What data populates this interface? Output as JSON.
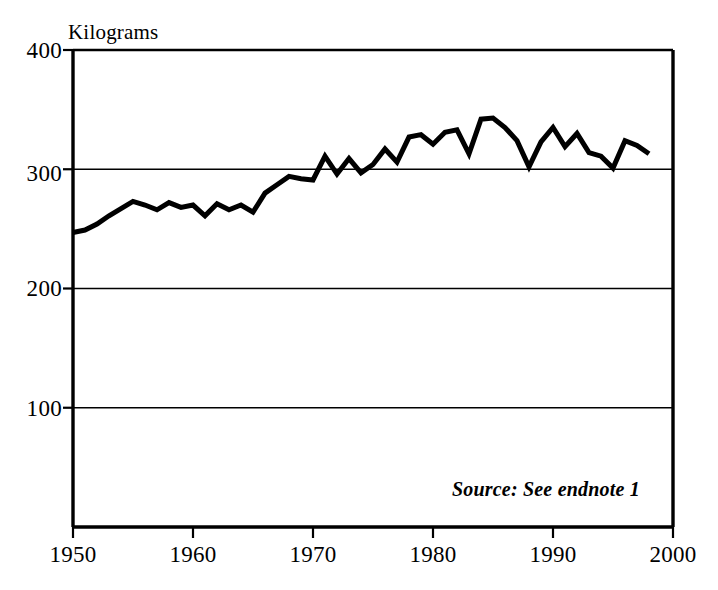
{
  "figure": {
    "y_axis_unit_label": "Kilograms",
    "source_note": "Source: See endnote 1"
  },
  "chart_data": {
    "type": "line",
    "title": "",
    "subtitle": "",
    "xlabel": "",
    "ylabel": "Kilograms",
    "ylim": [
      0,
      400
    ],
    "xlim": [
      1950,
      2000
    ],
    "y_ticks": [
      100,
      200,
      300,
      400
    ],
    "x_ticks": [
      1950,
      1960,
      1970,
      1980,
      1990,
      2000
    ],
    "grid": "horizontal",
    "legend": "none",
    "annotations": [
      "Source: See endnote 1"
    ],
    "line_color": "#000000",
    "line_width_px": 5,
    "series": [
      {
        "name": "Grain production per person",
        "units": "Kilograms",
        "x": [
          1950,
          1951,
          1952,
          1953,
          1954,
          1955,
          1956,
          1957,
          1958,
          1959,
          1960,
          1961,
          1962,
          1963,
          1964,
          1965,
          1966,
          1967,
          1968,
          1969,
          1970,
          1971,
          1972,
          1973,
          1974,
          1975,
          1976,
          1977,
          1978,
          1979,
          1980,
          1981,
          1982,
          1983,
          1984,
          1985,
          1986,
          1987,
          1988,
          1989,
          1990,
          1991,
          1992,
          1993,
          1994,
          1995,
          1996,
          1997,
          1998
        ],
        "values": [
          247,
          249,
          254,
          261,
          267,
          273,
          270,
          266,
          272,
          268,
          270,
          261,
          271,
          266,
          270,
          264,
          280,
          287,
          294,
          292,
          291,
          311,
          296,
          309,
          297,
          304,
          317,
          306,
          327,
          329,
          321,
          331,
          333,
          313,
          342,
          343,
          335,
          324,
          302,
          323,
          335,
          319,
          330,
          314,
          311,
          301,
          324,
          320,
          313
        ]
      }
    ]
  },
  "geometry": {
    "plot_left_px": 73,
    "plot_right_px": 673,
    "plot_top_px": 50,
    "plot_bottom_px": 527
  }
}
